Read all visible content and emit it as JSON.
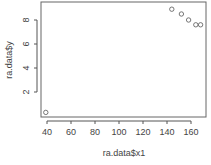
{
  "chart_data": {
    "type": "scatter",
    "title": "",
    "xlabel": "ra.data$x1",
    "ylabel": "ra.data$y",
    "x": [
      39,
      144,
      152,
      158,
      164,
      168
    ],
    "y": [
      0.3,
      8.9,
      8.5,
      8.0,
      7.6,
      7.6
    ],
    "xlim": [
      35,
      173
    ],
    "ylim": [
      0,
      9.3
    ],
    "xticks": [
      40,
      60,
      80,
      100,
      120,
      140,
      160
    ],
    "yticks": [
      2,
      4,
      6,
      8
    ],
    "grid": false,
    "legend": null,
    "marker": "open-circle",
    "colors": {
      "points": "#555555",
      "axes": "#555555",
      "text": "#444444"
    }
  }
}
